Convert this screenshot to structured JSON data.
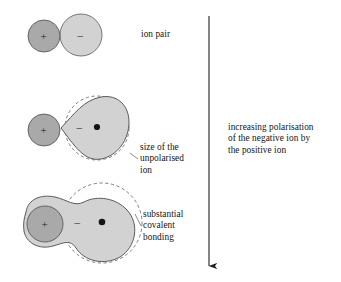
{
  "figure": {
    "width": 341,
    "height": 282,
    "background": "#ffffff"
  },
  "colors": {
    "positive_ion_fill": "#a9a9a9",
    "negative_ion_fill": "#d2d2d2",
    "outline": "#5a5a5a",
    "dashed_outline": "#6e6e6e",
    "text": "#141414",
    "arrow": "#1f1f1f"
  },
  "captions": {
    "ion_pair": "ion pair",
    "unpolarised": "size of the\nunpolarised\nion",
    "covalent": "substantial\ncovalent\nbonding",
    "increasing": "increasing polarisation\nof the negative ion by\nthe positive ion"
  },
  "symbols": {
    "plus": "+",
    "minus": "–",
    "nucleus_dot": "•"
  },
  "rows": [
    {
      "name": "ion-pair",
      "label": "ion pair",
      "positive_ion": {
        "cx": 44,
        "cy": 36,
        "r": 16
      },
      "negative_ion": {
        "cx": 81,
        "cy": 35,
        "r": 21
      },
      "polarisation": "none"
    },
    {
      "name": "polarised",
      "label": "size of the unpolarised ion",
      "positive_ion": {
        "cx": 44,
        "cy": 130,
        "r": 16
      },
      "negative_ion": {
        "cx": 97,
        "cy": 128,
        "r": 32
      },
      "polarisation": "partial"
    },
    {
      "name": "covalent",
      "label": "substantial covalent bonding",
      "positive_ion": {
        "cx": 44,
        "cy": 224,
        "r": 18
      },
      "negative_ion": {
        "cx": 102,
        "cy": 223,
        "r": 40
      },
      "polarisation": "substantial"
    }
  ],
  "arrow": {
    "name": "increasing-polarisation-arrow",
    "x": 209,
    "y_top": 16,
    "y_bottom": 272,
    "direction": "down"
  }
}
